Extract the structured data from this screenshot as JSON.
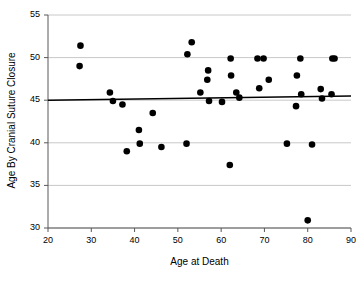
{
  "chart_data": {
    "type": "scatter",
    "title": "",
    "xlabel": "Age at Death",
    "ylabel": "Age By Cranial Suture Closure",
    "xlim": [
      20,
      90
    ],
    "ylim": [
      30,
      55
    ],
    "xticks": [
      20,
      30,
      40,
      50,
      60,
      70,
      80,
      90
    ],
    "yticks": [
      30,
      35,
      40,
      45,
      50,
      55
    ],
    "grid": "horizontal",
    "legend": "none",
    "marker_color": "#000000",
    "marker_size": 4,
    "trendline": {
      "label": "regression-line",
      "color": "#000000",
      "x": [
        20,
        90
      ],
      "y": [
        45.0,
        45.5
      ]
    },
    "points": [
      {
        "x": 27.5,
        "y": 51.4
      },
      {
        "x": 27.3,
        "y": 49.0
      },
      {
        "x": 34.3,
        "y": 45.9
      },
      {
        "x": 35.0,
        "y": 44.9
      },
      {
        "x": 37.2,
        "y": 44.5
      },
      {
        "x": 38.2,
        "y": 39.0
      },
      {
        "x": 41.0,
        "y": 41.5
      },
      {
        "x": 41.2,
        "y": 39.9
      },
      {
        "x": 44.2,
        "y": 43.5
      },
      {
        "x": 46.2,
        "y": 39.5
      },
      {
        "x": 52.0,
        "y": 39.9
      },
      {
        "x": 52.2,
        "y": 50.4
      },
      {
        "x": 53.2,
        "y": 51.8
      },
      {
        "x": 55.2,
        "y": 45.9
      },
      {
        "x": 56.8,
        "y": 47.4
      },
      {
        "x": 57.0,
        "y": 48.5
      },
      {
        "x": 57.2,
        "y": 44.9
      },
      {
        "x": 60.2,
        "y": 44.8
      },
      {
        "x": 62.0,
        "y": 37.4
      },
      {
        "x": 62.2,
        "y": 49.9
      },
      {
        "x": 62.3,
        "y": 47.9
      },
      {
        "x": 63.5,
        "y": 45.9
      },
      {
        "x": 64.2,
        "y": 45.3
      },
      {
        "x": 68.4,
        "y": 49.9
      },
      {
        "x": 68.8,
        "y": 46.4
      },
      {
        "x": 69.8,
        "y": 49.9
      },
      {
        "x": 71.0,
        "y": 47.4
      },
      {
        "x": 75.2,
        "y": 39.9
      },
      {
        "x": 77.3,
        "y": 44.3
      },
      {
        "x": 77.5,
        "y": 47.9
      },
      {
        "x": 78.3,
        "y": 49.9
      },
      {
        "x": 78.5,
        "y": 45.7
      },
      {
        "x": 80.0,
        "y": 30.9
      },
      {
        "x": 81.0,
        "y": 39.8
      },
      {
        "x": 83.0,
        "y": 46.3
      },
      {
        "x": 83.3,
        "y": 45.2
      },
      {
        "x": 85.5,
        "y": 45.7
      },
      {
        "x": 85.7,
        "y": 49.9
      },
      {
        "x": 86.2,
        "y": 49.9
      }
    ]
  },
  "axis": {
    "y_tick_labels": [
      "55",
      "50",
      "45",
      "40",
      "35",
      "30"
    ],
    "x_tick_labels": [
      "20",
      "30",
      "40",
      "50",
      "60",
      "70",
      "80",
      "90"
    ]
  },
  "colors": {
    "axis": "#595959",
    "grid": "#c8c8c8",
    "marker": "#000000",
    "trend": "#000000",
    "background": "#ffffff"
  }
}
